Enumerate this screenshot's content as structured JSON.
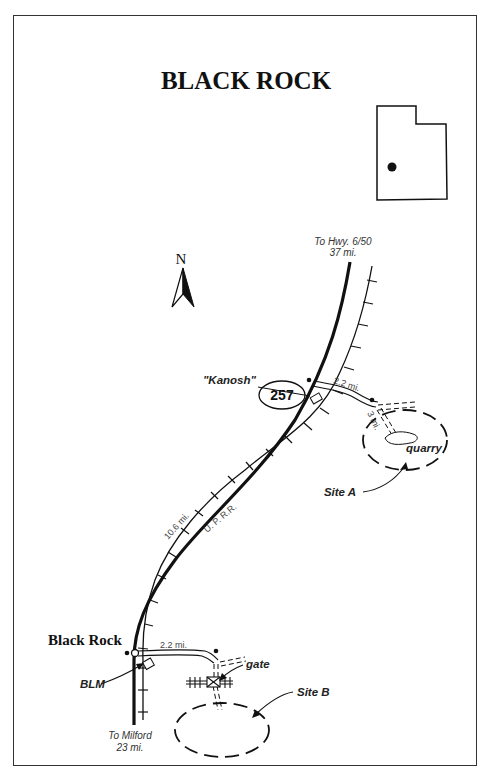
{
  "map": {
    "title": "BLACK ROCK",
    "north_label": "N",
    "inset": {
      "name": "utah-state-outline",
      "marker": "location-dot"
    },
    "highway": {
      "number": "257"
    },
    "labels": {
      "north_destination_line1": "To Hwy. 6/50",
      "north_destination_line2": "37 mi.",
      "south_destination_line1": "To Milford",
      "south_destination_line2": "23 mi.",
      "kanosh": "\"Kanosh\"",
      "black_rock": "Black Rock",
      "blm": "BLM",
      "gate": "gate",
      "quarry": "quarry",
      "site_a": "Site A",
      "site_b": "Site B",
      "railroad": "U. P. R.R.",
      "dist_kanosh_road": "2.2 mi.",
      "dist_quarry_spur": "3 mi.",
      "dist_highway": "10.6 mi.",
      "dist_black_rock_road": "2.2 mi."
    },
    "colors": {
      "ink": "#111111",
      "background": "#ffffff"
    }
  }
}
